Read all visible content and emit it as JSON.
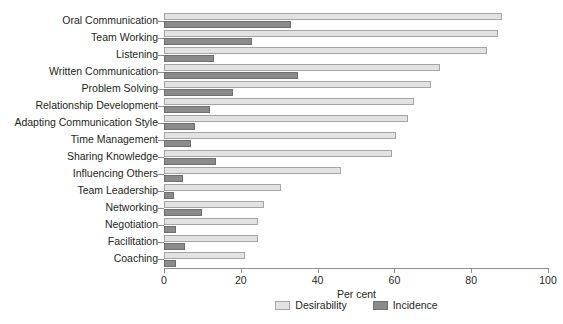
{
  "chart_data": {
    "type": "bar",
    "orientation": "horizontal",
    "title": "",
    "xlabel": "Per cent",
    "ylabel": "",
    "xlim": [
      0,
      100
    ],
    "xticks": [
      0,
      20,
      40,
      60,
      80,
      100
    ],
    "xtick_labels": [
      "0",
      "20",
      "40",
      "60",
      "80",
      "100"
    ],
    "grid": false,
    "legend_position": "bottom-center",
    "categories": [
      "Oral Communication",
      "Team Working",
      "Listening",
      "Written Communication",
      "Problem Solving",
      "Relationship Development",
      "Adapting Communication Style",
      "Time Management",
      "Sharing Knowledge",
      "Influencing Others",
      "Team Leadership",
      "Networking",
      "Negotiation",
      "Facilitation",
      "Coaching"
    ],
    "series": [
      {
        "name": "Desirability",
        "color": "#e2e2e2",
        "values": [
          88,
          87,
          84,
          72,
          69.5,
          65,
          63.5,
          60.5,
          59.5,
          46,
          30.5,
          26,
          24.5,
          24.5,
          21
        ]
      },
      {
        "name": "Incidence",
        "color": "#8b8b8b",
        "values": [
          33,
          23,
          13,
          35,
          18,
          12,
          8,
          7,
          13.5,
          5,
          2.5,
          10,
          3,
          5.5,
          3
        ]
      }
    ]
  },
  "legend": {
    "items": [
      {
        "label": "Desirability",
        "swatch": "desirability"
      },
      {
        "label": "Incidence",
        "swatch": "incidence"
      }
    ]
  }
}
